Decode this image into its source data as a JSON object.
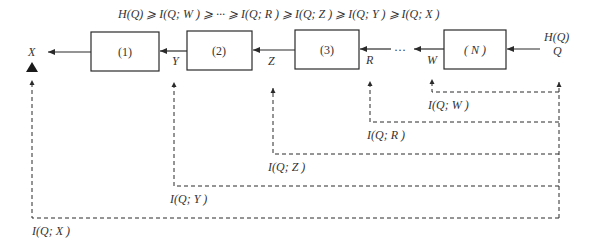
{
  "title": "H(Q) ⩾ I(Q; W ) ⩾ ··· ⩾ I(Q; R ) ⩾ I(Q; Z ) ⩾ I(Q; Y ) ⩾ I(Q; X )",
  "source": {
    "entropy_label": "H(Q)",
    "variable": "Q"
  },
  "blocks": [
    {
      "id": "1",
      "label": "(1)"
    },
    {
      "id": "2",
      "label": "(2)"
    },
    {
      "id": "3",
      "label": "(3)"
    },
    {
      "id": "N",
      "label": "( N )"
    }
  ],
  "signals": {
    "X": "X",
    "Y": "Y",
    "Z": "Z",
    "R": "R",
    "W": "W",
    "ellipsis": "···"
  },
  "mutual_information": {
    "W": "I(Q; W )",
    "R": "I(Q; R )",
    "Z": "I(Q; Z )",
    "Y": "I(Q; Y )",
    "X": "I(Q; X )"
  },
  "colors": {
    "line": "#2a2a2a",
    "background": "#ffffff"
  }
}
